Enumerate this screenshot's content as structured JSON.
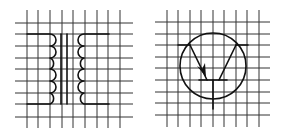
{
  "figure": {
    "panels": [
      {
        "id": "left",
        "symbol": "transformer",
        "description": "Iron-core transformer symbol drawn on square grid",
        "primary_coil_loops": 4,
        "secondary_coil_loops": 4,
        "core_lines": 2
      },
      {
        "id": "right",
        "symbol": "pnp-transistor",
        "description": "Bipolar transistor symbol (emitter arrow pointing inward) in a circle on square grid"
      }
    ],
    "grid": {
      "vertical_lines": 9,
      "horizontal_lines": 9
    },
    "colors": {
      "line": "#111111",
      "grid": "#333333",
      "background": "#ffffff"
    }
  }
}
